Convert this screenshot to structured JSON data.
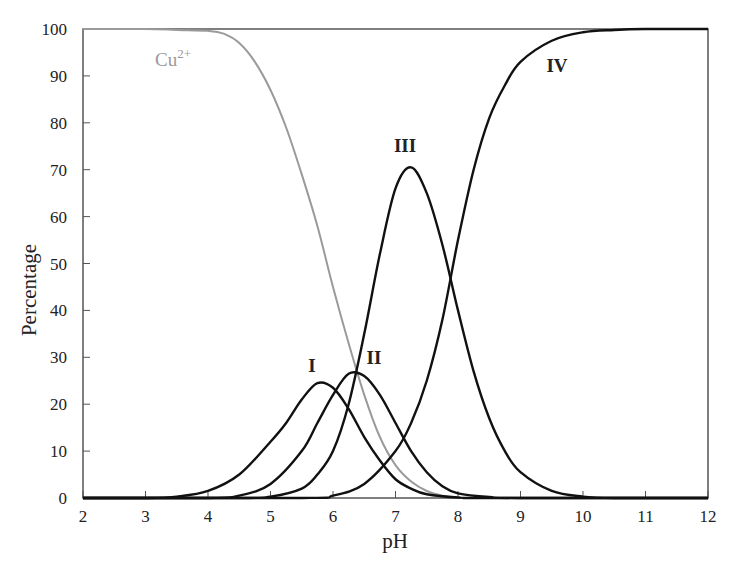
{
  "chart_data": {
    "type": "line",
    "title": "",
    "xlabel": "pH",
    "ylabel": "Percentage",
    "xlim": [
      2,
      12
    ],
    "ylim": [
      0,
      100
    ],
    "grid": false,
    "legend": "none (inline curve labels)",
    "x_ticks": [
      "2",
      "3",
      "4",
      "5",
      "6",
      "7",
      "8",
      "9",
      "10",
      "11",
      "12"
    ],
    "y_ticks": [
      "0",
      "10",
      "20",
      "30",
      "40",
      "50",
      "60",
      "70",
      "80",
      "90",
      "100"
    ],
    "series": [
      {
        "name": "Cu2+",
        "label_text": "Cu",
        "label_sup": "2+",
        "color": "#9a9a9a",
        "label_pos": [
          173,
          66
        ],
        "points": [
          [
            2,
            100
          ],
          [
            3,
            100
          ],
          [
            3.5,
            99.8
          ],
          [
            4,
            99.6
          ],
          [
            4.25,
            99
          ],
          [
            4.5,
            97
          ],
          [
            4.75,
            93
          ],
          [
            5,
            87
          ],
          [
            5.25,
            79
          ],
          [
            5.5,
            69
          ],
          [
            5.75,
            58
          ],
          [
            6,
            45
          ],
          [
            6.25,
            33
          ],
          [
            6.5,
            22
          ],
          [
            6.75,
            13
          ],
          [
            7,
            7
          ],
          [
            7.25,
            3.5
          ],
          [
            7.5,
            1.5
          ],
          [
            7.75,
            0.5
          ],
          [
            8,
            0.1
          ],
          [
            8.5,
            0
          ],
          [
            12,
            0
          ]
        ]
      },
      {
        "name": "I",
        "color": "#111111",
        "label_pos": [
          312,
          372
        ],
        "points": [
          [
            2,
            0
          ],
          [
            3,
            0
          ],
          [
            3.5,
            0.3
          ],
          [
            4,
            1.5
          ],
          [
            4.5,
            5
          ],
          [
            5,
            12
          ],
          [
            5.25,
            16
          ],
          [
            5.5,
            21
          ],
          [
            5.75,
            24.5
          ],
          [
            6,
            23.5
          ],
          [
            6.25,
            19
          ],
          [
            6.5,
            13
          ],
          [
            6.75,
            8
          ],
          [
            7,
            4
          ],
          [
            7.25,
            2
          ],
          [
            7.5,
            0.8
          ],
          [
            8,
            0.1
          ],
          [
            8.5,
            0
          ],
          [
            12,
            0
          ]
        ]
      },
      {
        "name": "II",
        "color": "#111111",
        "label_pos": [
          374,
          364
        ],
        "points": [
          [
            2,
            0
          ],
          [
            4,
            0
          ],
          [
            4.5,
            0.5
          ],
          [
            5,
            3
          ],
          [
            5.5,
            10
          ],
          [
            5.75,
            16
          ],
          [
            6,
            22
          ],
          [
            6.25,
            26.5
          ],
          [
            6.5,
            26
          ],
          [
            6.75,
            22
          ],
          [
            7,
            16
          ],
          [
            7.25,
            10
          ],
          [
            7.5,
            5.5
          ],
          [
            7.75,
            2.5
          ],
          [
            8,
            1
          ],
          [
            8.5,
            0.2
          ],
          [
            9,
            0
          ],
          [
            12,
            0
          ]
        ]
      },
      {
        "name": "III",
        "color": "#111111",
        "label_pos": [
          405,
          152
        ],
        "points": [
          [
            2,
            0
          ],
          [
            4.5,
            0
          ],
          [
            5,
            0.3
          ],
          [
            5.5,
            2
          ],
          [
            5.75,
            5
          ],
          [
            6,
            10
          ],
          [
            6.25,
            20
          ],
          [
            6.5,
            35
          ],
          [
            6.75,
            52
          ],
          [
            7,
            66
          ],
          [
            7.25,
            70.5
          ],
          [
            7.5,
            65
          ],
          [
            7.75,
            54
          ],
          [
            8,
            40
          ],
          [
            8.25,
            27
          ],
          [
            8.5,
            17
          ],
          [
            8.75,
            10
          ],
          [
            9,
            5.5
          ],
          [
            9.5,
            1.5
          ],
          [
            10,
            0.3
          ],
          [
            10.5,
            0
          ],
          [
            12,
            0
          ]
        ]
      },
      {
        "name": "IV",
        "color": "#111111",
        "label_pos": [
          557,
          72
        ],
        "points": [
          [
            2,
            0
          ],
          [
            5.5,
            0
          ],
          [
            6,
            0.5
          ],
          [
            6.5,
            3
          ],
          [
            7,
            10
          ],
          [
            7.25,
            16
          ],
          [
            7.5,
            25
          ],
          [
            7.75,
            38
          ],
          [
            8,
            55
          ],
          [
            8.25,
            70
          ],
          [
            8.5,
            81
          ],
          [
            8.75,
            88
          ],
          [
            9,
            93
          ],
          [
            9.5,
            97.5
          ],
          [
            10,
            99.3
          ],
          [
            10.5,
            99.8
          ],
          [
            11,
            100
          ],
          [
            12,
            100
          ]
        ]
      }
    ]
  }
}
